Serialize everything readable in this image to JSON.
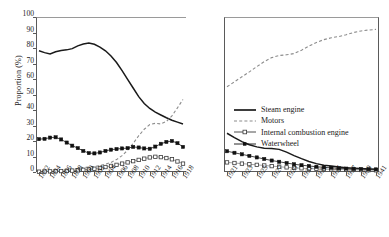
{
  "chart_data": {
    "type": "line",
    "title": "",
    "xlabel": "",
    "ylabel": "Proportion (%)",
    "ylim": [
      0,
      100
    ],
    "ytick_values": [
      0,
      10,
      20,
      30,
      40,
      50,
      60,
      70,
      80,
      90,
      100
    ],
    "grid": false,
    "legend_position": "center-right",
    "panels": [
      {
        "name": "left-panel",
        "x": [
          1892,
          1893,
          1894,
          1895,
          1896,
          1897,
          1898,
          1899,
          1900,
          1901,
          1902,
          1903,
          1904,
          1905,
          1906,
          1907,
          1908,
          1909,
          1910,
          1911,
          1912,
          1913,
          1914,
          1915,
          1916,
          1917,
          1918
        ],
        "xtick_labels": [
          "1892",
          "1894",
          "1896",
          "1898",
          "1900",
          "1902",
          "1904",
          "1906",
          "1908",
          "1910",
          "1912",
          "1914",
          "1916",
          "1918"
        ],
        "xtick_values": [
          1892,
          1894,
          1896,
          1898,
          1900,
          1902,
          1904,
          1906,
          1908,
          1910,
          1912,
          1914,
          1916,
          1918
        ],
        "series": [
          {
            "name": "Steam engine",
            "values": [
              78.2,
              77.0,
              76.2,
              77.6,
              78.4,
              78.8,
              79.6,
              81.4,
              82.6,
              83.2,
              82.4,
              80.6,
              78.2,
              74.8,
              70.6,
              65.4,
              59.8,
              54.2,
              48.6,
              44.2,
              41.0,
              38.6,
              36.8,
              35.0,
              33.4,
              32.2,
              31.0
            ]
          },
          {
            "name": "Motors",
            "values": [
              0.2,
              0.3,
              0.4,
              0.5,
              0.8,
              1.2,
              1.8,
              2.3,
              2.8,
              3.2,
              3.6,
              4.2,
              5.0,
              6.2,
              8.0,
              10.6,
              14.0,
              18.4,
              23.4,
              27.6,
              30.6,
              31.4,
              31.0,
              32.6,
              36.2,
              41.4,
              46.8
            ]
          },
          {
            "name": "Internal combustion engine",
            "values": [
              0.2,
              0.3,
              0.4,
              0.5,
              0.6,
              0.7,
              0.9,
              1.1,
              1.4,
              1.7,
              2.1,
              2.6,
              3.2,
              3.9,
              4.6,
              5.4,
              6.2,
              7.0,
              7.8,
              8.6,
              9.4,
              9.8,
              9.6,
              9.0,
              8.2,
              6.8,
              5.4
            ]
          },
          {
            "name": "Waterwheel",
            "values": [
              21.2,
              21.4,
              22.2,
              22.4,
              21.0,
              19.0,
              17.0,
              15.4,
              13.6,
              12.2,
              12.0,
              12.6,
              13.6,
              14.4,
              14.8,
              15.2,
              15.4,
              16.2,
              15.8,
              15.2,
              15.0,
              16.4,
              18.2,
              19.4,
              20.0,
              18.6,
              16.2
            ]
          }
        ]
      },
      {
        "name": "right-panel",
        "x": [
          1921,
          1922,
          1923,
          1924,
          1925,
          1926,
          1927,
          1928,
          1929,
          1930,
          1931,
          1932,
          1933,
          1934,
          1935,
          1936,
          1937,
          1938,
          1939,
          1940,
          1941
        ],
        "xtick_labels": [
          "1921",
          "1923",
          "1925",
          "1927",
          "1929",
          "1931",
          "1933",
          "1935",
          "1937",
          "1939",
          "1941"
        ],
        "xtick_values": [
          1921,
          1923,
          1925,
          1927,
          1929,
          1931,
          1933,
          1935,
          1937,
          1939,
          1941
        ],
        "series": [
          {
            "name": "Steam engine",
            "values": [
              25.0,
              22.2,
              19.6,
              17.6,
              16.2,
              15.4,
              15.2,
              14.6,
              12.8,
              10.6,
              8.6,
              6.8,
              5.4,
              4.4,
              3.8,
              3.2,
              2.8,
              2.5,
              2.2,
              2.0,
              1.8
            ]
          },
          {
            "name": "Motors",
            "values": [
              55.0,
              58.2,
              61.4,
              64.6,
              68.0,
              71.2,
              73.8,
              75.2,
              75.6,
              76.4,
              78.6,
              81.2,
              83.6,
              85.4,
              86.6,
              87.4,
              88.6,
              90.0,
              91.0,
              91.6,
              92.0
            ]
          },
          {
            "name": "Internal combustion engine",
            "values": [
              6.2,
              5.8,
              5.4,
              5.0,
              4.6,
              4.2,
              3.8,
              3.4,
              3.0,
              2.7,
              2.4,
              2.2,
              2.0,
              1.8,
              1.7,
              1.6,
              1.5,
              1.4,
              1.3,
              1.2,
              1.1
            ]
          },
          {
            "name": "Waterwheel",
            "values": [
              13.4,
              12.4,
              11.4,
              10.4,
              9.4,
              8.4,
              7.4,
              6.6,
              5.8,
              5.0,
              4.4,
              3.9,
              3.4,
              3.0,
              2.7,
              2.4,
              2.2,
              2.0,
              1.9,
              1.8,
              1.7
            ]
          }
        ]
      }
    ],
    "legend": [
      {
        "label": "Steam engine",
        "style": "solid-thick",
        "color": "#1a1a1a"
      },
      {
        "label": "Motors",
        "style": "dashed",
        "color": "#8c8c8c"
      },
      {
        "label": "Internal combustion engine",
        "style": "line-open-square",
        "color": "#3a3a3a"
      },
      {
        "label": "Waterwheel",
        "style": "line-filled-square",
        "color": "#111111"
      }
    ]
  }
}
